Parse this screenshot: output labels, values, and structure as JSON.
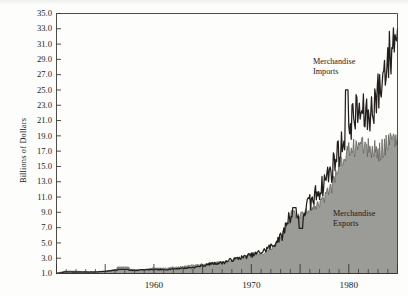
{
  "figure": {
    "name": "us-merchandise-trade-chart",
    "background_color": "#fdfdfc",
    "line_color": "#231f1d",
    "area_fill_color": "#9b9b98",
    "axis_color": "#3a3734"
  },
  "axes": {
    "y_axis_title": "Billions of Dollars",
    "y_tick_labels": [
      "35.0",
      "33.0",
      "31.0",
      "29.0",
      "27.0",
      "25.0",
      "23.0",
      "21.0",
      "19.0",
      "17.0",
      "15.0",
      "13.0",
      "11.0",
      "9.0",
      "7.0",
      "5.0",
      "3.0",
      "1.0"
    ],
    "x_tick_labels": [
      "1960",
      "1970",
      "1980"
    ]
  },
  "annotations": [
    {
      "name": "merchandise-imports-label",
      "line1": "Merchandise",
      "line2": "Imports",
      "x": 313,
      "y": 57
    },
    {
      "name": "merchandise-exports-label",
      "line1": "Merchandise",
      "line2": "Exports",
      "x": 333,
      "y": 209
    }
  ],
  "chart_data": {
    "type": "area",
    "title": "",
    "subtitle": "",
    "xlabel": "",
    "ylabel": "Billions of Dollars",
    "xlim": [
      1950,
      1985
    ],
    "ylim": [
      1.0,
      35.0
    ],
    "y_tick_step": 2.0,
    "x_major_tick_step": 5,
    "x_minor_tick_step": 1,
    "grid": false,
    "legend": "inline-annotations",
    "units": "Billions of Dollars (monthly, annualized scale)",
    "x": [
      1950,
      1951,
      1952,
      1953,
      1954,
      1955,
      1956,
      1957,
      1958,
      1959,
      1960,
      1961,
      1962,
      1963,
      1964,
      1965,
      1966,
      1967,
      1968,
      1969,
      1970,
      1971,
      1972,
      1973,
      1974,
      1975,
      1976,
      1977,
      1978,
      1979,
      1980,
      1981,
      1982,
      1983,
      1984,
      1985
    ],
    "series": [
      {
        "name": "Merchandise Imports",
        "style": "line",
        "values": [
          1.0,
          1.2,
          1.2,
          1.2,
          1.2,
          1.3,
          1.4,
          1.5,
          1.4,
          1.5,
          1.5,
          1.5,
          1.6,
          1.7,
          1.8,
          2.0,
          2.3,
          2.4,
          2.8,
          3.1,
          3.4,
          3.8,
          4.5,
          5.7,
          8.6,
          8.3,
          10.2,
          12.0,
          14.1,
          17.0,
          20.8,
          22.1,
          21.5,
          24.5,
          29.0,
          33.0
        ]
      },
      {
        "name": "Merchandise Exports",
        "style": "filled-area",
        "values": [
          1.1,
          1.3,
          1.3,
          1.2,
          1.2,
          1.3,
          1.5,
          1.7,
          1.5,
          1.5,
          1.7,
          1.7,
          1.8,
          1.9,
          2.1,
          2.2,
          2.4,
          2.5,
          2.8,
          3.1,
          3.5,
          3.6,
          4.1,
          5.8,
          8.2,
          8.8,
          9.5,
          10.0,
          12.0,
          15.0,
          17.0,
          18.0,
          17.3,
          17.0,
          18.0,
          18.6
        ]
      }
    ],
    "notes": [
      "Imports line rises above exports area persistently after 1971, widening sharply after 1976.",
      "Month-to-month volatility is large after 1973; a local imports spike reaching about 25 occurs near 1980.",
      "A small local bump in both series occurs around 1956-1957.",
      "Exports area plateaus in the 17-19 range after 1980 while imports continue up past 33."
    ]
  }
}
